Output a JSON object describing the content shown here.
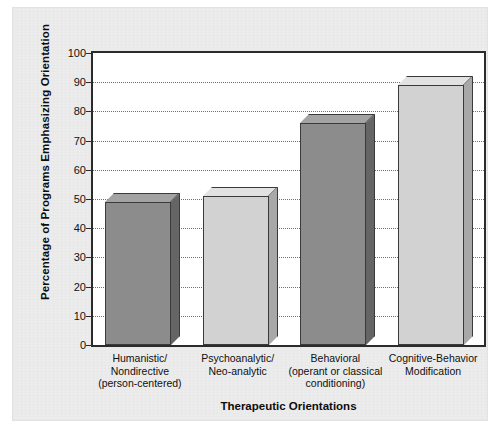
{
  "chart_data": {
    "type": "bar",
    "title": "",
    "xlabel": "Therapeutic Orientations",
    "ylabel": "Percentage of Programs Emphasizing Orientation",
    "categories": [
      "Humanistic/\nNondirective\n(person-centered)",
      "Psychoanalytic/\nNeo-analytic",
      "Behavioral\n(operant or classical\nconditioning)",
      "Cognitive-Behavior\nModification"
    ],
    "category_lines": [
      [
        "Humanistic/",
        "Nondirective",
        "(person-centered)"
      ],
      [
        "Psychoanalytic/",
        "Neo-analytic"
      ],
      [
        "Behavioral",
        "(operant or classical",
        "conditioning)"
      ],
      [
        "Cognitive-Behavior",
        "Modification"
      ]
    ],
    "values": [
      49,
      51,
      76,
      89
    ],
    "ylim": [
      0,
      100
    ],
    "yticks": [
      0,
      10,
      20,
      30,
      40,
      50,
      60,
      70,
      80,
      90,
      100
    ],
    "ytick_labels": [
      "0",
      "10",
      "20",
      "30",
      "40",
      "50",
      "60",
      "70",
      "80",
      "90",
      "100"
    ],
    "grid": true,
    "grid_style": "dotted-horizontal",
    "legend": "none",
    "bar_style": "3d-extruded",
    "bar_colors": [
      "#8c8c8c",
      "#d2d2d2",
      "#8c8c8c",
      "#d2d2d2"
    ],
    "bar_top_colors": [
      "#a3a3a3",
      "#e2e2e2",
      "#a3a3a3",
      "#e2e2e2"
    ],
    "bar_side_colors": [
      "#656565",
      "#a8a8a8",
      "#656565",
      "#a8a8a8"
    ],
    "bar_edge_color": "#3a3a3a",
    "axis_color": "#2b2b2b",
    "plot_background": "#ffffff",
    "figure_background": "#ececec"
  }
}
